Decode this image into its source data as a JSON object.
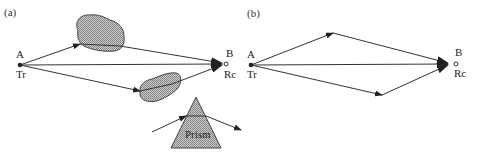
{
  "diagram": {
    "type": "multipath-propagation",
    "panels": [
      {
        "id": "a",
        "label": "(a)",
        "transmitter": {
          "point": "A",
          "role": "Tr"
        },
        "receiver": {
          "point": "B",
          "role": "Rc"
        },
        "paths": [
          "direct",
          "upper-scattered-via-obstacle",
          "lower-scattered-via-obstacle"
        ],
        "inset": {
          "label": "Prism"
        }
      },
      {
        "id": "b",
        "label": "(b)",
        "transmitter": {
          "point": "A",
          "role": "Tr"
        },
        "receiver": {
          "point": "B",
          "role": "Rc"
        },
        "paths": [
          "direct",
          "upper-reflected",
          "lower-reflected"
        ]
      }
    ]
  },
  "colors": {
    "line": "#333333",
    "fill_stipple": "#9a9a9a",
    "background": "#ffffff"
  }
}
